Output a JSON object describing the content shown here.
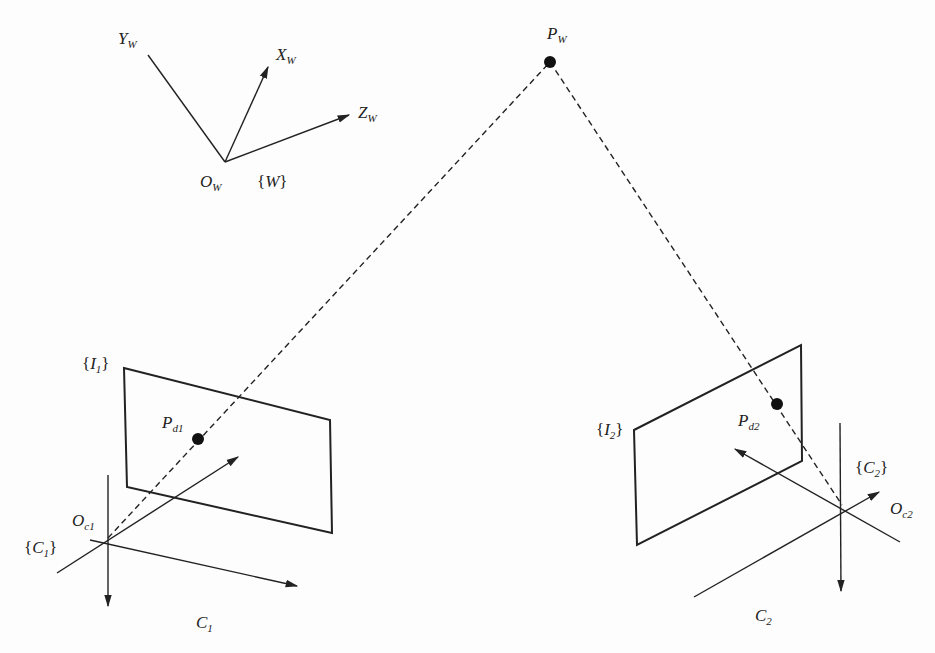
{
  "diagram": {
    "world_frame": {
      "origin_label": "O",
      "origin_sub": "W",
      "frame_label": "W",
      "x_axis": "X",
      "x_sub": "W",
      "y_axis": "Y",
      "y_sub": "W",
      "z_axis": "Z",
      "z_sub": "W"
    },
    "world_point": {
      "label": "P",
      "sub": "W"
    },
    "camera1": {
      "image_plane_label": "I",
      "image_plane_sub": "1",
      "projected_point": "P",
      "projected_sub": "d1",
      "origin_label": "O",
      "origin_sub": "c1",
      "frame_label": "C",
      "frame_sub": "1",
      "camera_label": "C",
      "camera_sub": "1"
    },
    "camera2": {
      "image_plane_label": "I",
      "image_plane_sub": "2",
      "projected_point": "P",
      "projected_sub": "d2",
      "origin_label": "O",
      "origin_sub": "c2",
      "frame_label": "C",
      "frame_sub": "2",
      "camera_label": "C",
      "camera_sub": "2"
    },
    "colors": {
      "stroke": "#222222",
      "background": "#fdfdfd"
    }
  }
}
